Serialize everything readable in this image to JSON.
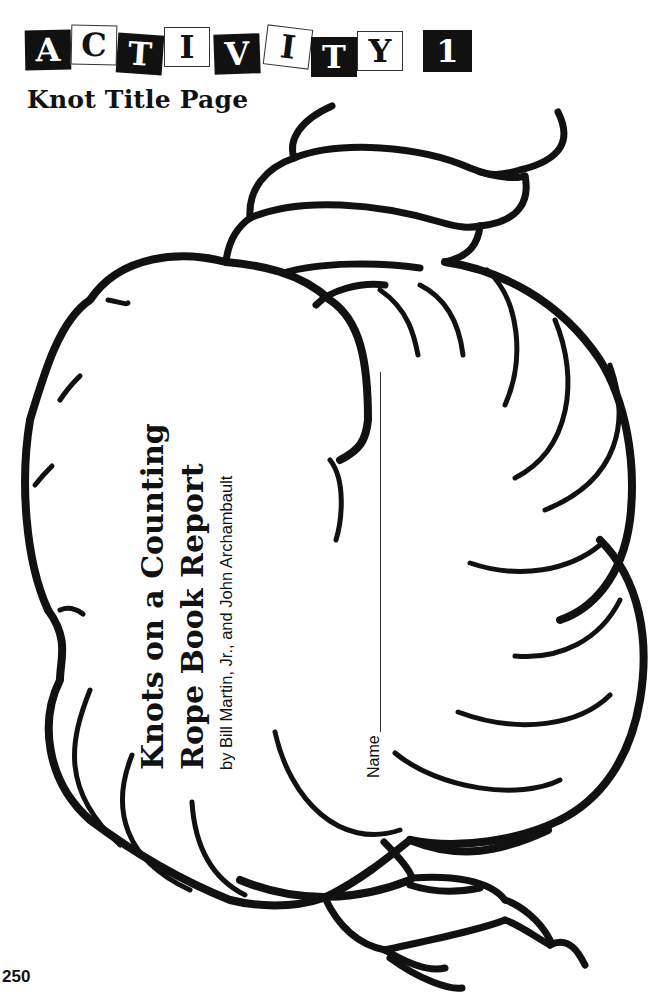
{
  "header": {
    "activity_tiles": [
      {
        "char": "A",
        "style": "dark"
      },
      {
        "char": "C",
        "style": "light"
      },
      {
        "char": "T",
        "style": "dark"
      },
      {
        "char": "I",
        "style": "light"
      },
      {
        "char": "V",
        "style": "dark"
      },
      {
        "char": "I",
        "style": "light"
      },
      {
        "char": "T",
        "style": "dark"
      },
      {
        "char": "Y",
        "style": "light"
      },
      {
        "char": "1",
        "style": "dark"
      }
    ],
    "activity_word": "ACTIVITY",
    "activity_number": "1",
    "subtitle": "Knot Title Page"
  },
  "illustration": {
    "subject": "rope-knot-outline",
    "line_color": "#111111",
    "fill_color": "#ffffff"
  },
  "book": {
    "title_line_1": "Knots on a Counting",
    "title_line_2": "Rope Book Report",
    "authors": "by Bill Martin, Jr., and John Archambault"
  },
  "name_field": {
    "label": "Name",
    "value": ""
  },
  "footer": {
    "page_number": "250"
  },
  "colors": {
    "ink": "#111111",
    "paper": "#ffffff"
  }
}
